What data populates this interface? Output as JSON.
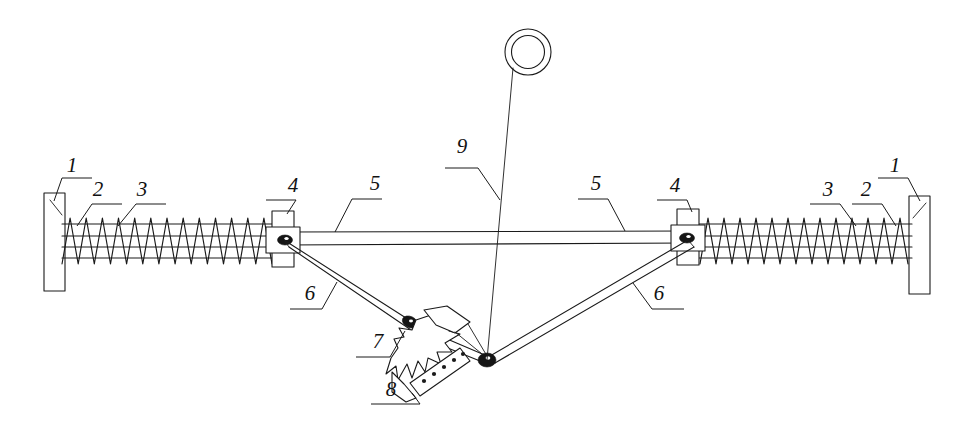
{
  "figure": {
    "background_color": "#ffffff",
    "line_color": "#1a1a1a",
    "width": 961,
    "height": 436
  },
  "callouts": [
    {
      "id": "c1-left",
      "label": "1",
      "x": 72,
      "y": 172,
      "part": "end-mounting-plate-left"
    },
    {
      "id": "c2-left",
      "label": "2",
      "x": 98,
      "y": 196,
      "part": "spring-outer-left"
    },
    {
      "id": "c3-left",
      "label": "3",
      "x": 142,
      "y": 196,
      "part": "guide-rod-left"
    },
    {
      "id": "c4-left",
      "label": "4",
      "x": 293,
      "y": 192,
      "part": "slider-block-left"
    },
    {
      "id": "c5-left",
      "label": "5",
      "x": 375,
      "y": 190,
      "part": "main-horizontal-beam-left"
    },
    {
      "id": "c9",
      "label": "9",
      "x": 462,
      "y": 153,
      "part": "lifting-rope-and-ring"
    },
    {
      "id": "c5-right",
      "label": "5",
      "x": 596,
      "y": 190,
      "part": "main-horizontal-beam-right"
    },
    {
      "id": "c4-right",
      "label": "4",
      "x": 675,
      "y": 192,
      "part": "slider-block-right"
    },
    {
      "id": "c3-right",
      "label": "3",
      "x": 828,
      "y": 196,
      "part": "guide-rod-right"
    },
    {
      "id": "c2-right",
      "label": "2",
      "x": 866,
      "y": 196,
      "part": "spring-outer-right"
    },
    {
      "id": "c1-right",
      "label": "1",
      "x": 895,
      "y": 172,
      "part": "end-mounting-plate-right"
    },
    {
      "id": "c6-left",
      "label": "6",
      "x": 310,
      "y": 300,
      "part": "diagonal-strut-left"
    },
    {
      "id": "c6-right",
      "label": "6",
      "x": 659,
      "y": 300,
      "part": "diagonal-strut-right"
    },
    {
      "id": "c7",
      "label": "7",
      "x": 378,
      "y": 348,
      "part": "pivot-joint-upper"
    },
    {
      "id": "c8",
      "label": "8",
      "x": 391,
      "y": 396,
      "part": "toothed-gripping-jaw"
    }
  ],
  "parts": {
    "end-mounting-plate-left": {
      "number": "1",
      "name": "End mounting plate (left)"
    },
    "end-mounting-plate-right": {
      "number": "1",
      "name": "End mounting plate (right)"
    },
    "spring-outer-left": {
      "number": "2",
      "name": "Helical compression spring (left)"
    },
    "spring-outer-right": {
      "number": "2",
      "name": "Helical compression spring (right)"
    },
    "guide-rod-left": {
      "number": "3",
      "name": "Guide rod (left)"
    },
    "guide-rod-right": {
      "number": "3",
      "name": "Guide rod (right)"
    },
    "slider-block-left": {
      "number": "4",
      "name": "Slider block / pivot housing (left)"
    },
    "slider-block-right": {
      "number": "4",
      "name": "Slider block / pivot housing (right)"
    },
    "main-horizontal-beam-left": {
      "number": "5",
      "name": "Main horizontal beam (left span)"
    },
    "main-horizontal-beam-right": {
      "number": "5",
      "name": "Main horizontal beam (right span)"
    },
    "diagonal-strut-left": {
      "number": "6",
      "name": "Diagonal strut / linkage arm (left)"
    },
    "diagonal-strut-right": {
      "number": "6",
      "name": "Diagonal strut / linkage arm (right)"
    },
    "pivot-joint-upper": {
      "number": "7",
      "name": "Upper pivot joint"
    },
    "toothed-gripping-jaw": {
      "number": "8",
      "name": "Toothed gripping jaw"
    },
    "lifting-rope-and-ring": {
      "number": "9",
      "name": "Lifting rope with suspension ring"
    }
  },
  "geometry": {
    "beam_y_top": 233,
    "beam_y_bottom": 245,
    "node_left": {
      "x": 285,
      "y": 240
    },
    "node_right": {
      "x": 687,
      "y": 238
    },
    "apex": {
      "x": 487,
      "y": 360
    },
    "ring_center": {
      "x": 528,
      "y": 52
    },
    "ring_outer_r": 23,
    "ring_inner_r": 16,
    "spring_left_start": 62,
    "spring_left_end": 272,
    "spring_right_start": 700,
    "spring_right_end": 908,
    "spring_coils": 13
  }
}
